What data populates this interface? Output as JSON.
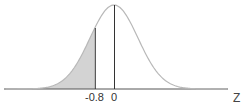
{
  "chart_data": {
    "type": "area",
    "title": "",
    "distribution": "standard normal",
    "xlabel": "Z",
    "ylabel": "",
    "tick_labels": [
      "-0.8",
      "0"
    ],
    "ticks": [
      -0.8,
      0
    ],
    "shaded_region": {
      "from": "-inf",
      "to": -0.8
    },
    "vertical_lines": [
      -0.8,
      0
    ],
    "xlim": [
      -4.5,
      4.7
    ],
    "grid": false,
    "legend": null
  },
  "colors": {
    "curve": "#b8b8b8",
    "shade": "#d3d3d3",
    "lines": "#333333",
    "axis": "#555555"
  }
}
